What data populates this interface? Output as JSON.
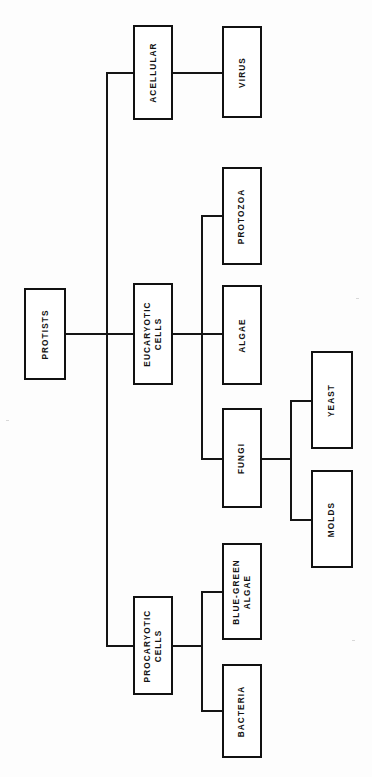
{
  "diagram": {
    "orientation": "rotated-90-left",
    "background_color": "#fdfdfd",
    "line_color": "#151515",
    "box_border_color": "#111111",
    "box_fill_color": "#ffffff",
    "text_color": "#131313"
  },
  "nodes": {
    "protists": {
      "label": "PROTISTS",
      "level": 0
    },
    "acellular": {
      "label": "ACELLULAR",
      "level": 1
    },
    "eucaryotic_cells": {
      "label": "EUCARYOTIC\nCELLS",
      "level": 1
    },
    "procaryotic_cells": {
      "label": "PROCARYOTIC\nCELLS",
      "level": 1
    },
    "virus": {
      "label": "VIRUS",
      "level": 2
    },
    "protozoa": {
      "label": "PROTOZOA",
      "level": 2
    },
    "algae": {
      "label": "ALGAE",
      "level": 2
    },
    "fungi": {
      "label": "FUNGI",
      "level": 2
    },
    "blue_green_algae": {
      "label": "BLUE-GREEN\nALGAE",
      "level": 2
    },
    "bacteria": {
      "label": "BACTERIA",
      "level": 2
    },
    "yeast": {
      "label": "YEAST",
      "level": 3
    },
    "molds": {
      "label": "MOLDS",
      "level": 3
    }
  },
  "edges": [
    {
      "from": "protists",
      "to": "acellular"
    },
    {
      "from": "protists",
      "to": "eucaryotic_cells"
    },
    {
      "from": "protists",
      "to": "procaryotic_cells"
    },
    {
      "from": "acellular",
      "to": "virus"
    },
    {
      "from": "eucaryotic_cells",
      "to": "protozoa"
    },
    {
      "from": "eucaryotic_cells",
      "to": "algae"
    },
    {
      "from": "eucaryotic_cells",
      "to": "fungi"
    },
    {
      "from": "procaryotic_cells",
      "to": "blue_green_algae"
    },
    {
      "from": "procaryotic_cells",
      "to": "bacteria"
    },
    {
      "from": "fungi",
      "to": "yeast"
    },
    {
      "from": "fungi",
      "to": "molds"
    }
  ]
}
